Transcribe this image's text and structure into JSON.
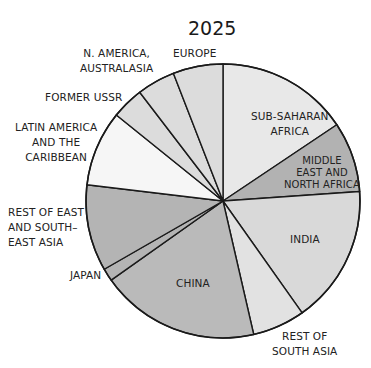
{
  "chart_data": {
    "type": "pie",
    "title": "2025",
    "start_angle_deg": 0,
    "direction": "clockwise",
    "unit": "percent (estimated from slice angles)",
    "slices": [
      {
        "label": "SUB-SAHARAN AFRICA",
        "value": 15.6,
        "color": "#e8e8e8"
      },
      {
        "label": "MIDDLE EAST AND NORTH AFRICA",
        "value": 8.3,
        "color": "#b2b2b2"
      },
      {
        "label": "INDIA",
        "value": 16.3,
        "color": "#d9d9d9"
      },
      {
        "label": "REST OF SOUTH ASIA",
        "value": 6.2,
        "color": "#e2e2e2"
      },
      {
        "label": "CHINA",
        "value": 18.8,
        "color": "#bababa"
      },
      {
        "label": "JAPAN",
        "value": 1.5,
        "color": "#b4b4b4"
      },
      {
        "label": "REST OF EAST AND SOUTH-EAST ASIA",
        "value": 10.2,
        "color": "#b4b4b4"
      },
      {
        "label": "LATIN AMERICA AND THE CARIBBEAN",
        "value": 8.9,
        "color": "#f6f6f6"
      },
      {
        "label": "FORMER USSR",
        "value": 3.8,
        "color": "#dcdcdc"
      },
      {
        "label": "N. AMERICA, AUSTRALASIA",
        "value": 4.5,
        "color": "#dcdcdc"
      },
      {
        "label": "EUROPE",
        "value": 5.9,
        "color": "#dcdcdc"
      }
    ],
    "legend": "none (labels placed inside/outside slices)"
  },
  "labels": {
    "title": "2025",
    "ssa": "SUB-SAHARAN\nAFRICA",
    "mena": "MIDDLE\nEAST AND\nNORTH AFRICA",
    "india": "INDIA",
    "rsa": "REST OF\nSOUTH ASIA",
    "china": "CHINA",
    "japan": "JAPAN",
    "rest_east": "REST OF EAST\nAND SOUTH–\nEAST ASIA",
    "latin": "LATIN AMERICA\nAND THE\nCARIBBEAN",
    "fussr": "FORMER USSR",
    "nam": "N. AMERICA,\nAUSTRALASIA",
    "europe": "EUROPE"
  }
}
